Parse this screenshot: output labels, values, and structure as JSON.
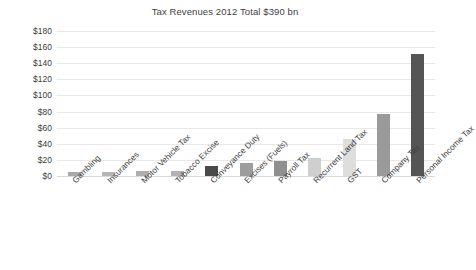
{
  "chart_data": {
    "type": "bar",
    "title": "Tax Revenues 2012 Total $390 bn",
    "xlabel": "",
    "ylabel": "",
    "ylim": [
      0,
      180
    ],
    "ytick_step": 20,
    "ytick_prefix": "$",
    "grid": true,
    "legend": false,
    "legend_position": "none",
    "x_label_rotation": -45,
    "categories": [
      "Gambling",
      "Insurances",
      "Motor Vehicle Tax",
      "Tobacco Excise",
      "Conveyance Duty",
      "Excises (Fuels)",
      "Payroll Tax",
      "Recurrent Land Tax",
      "GST",
      "Company Tax",
      "Personal Income Tax"
    ],
    "values": [
      5,
      5,
      6,
      6,
      12,
      16,
      19,
      22,
      46,
      77,
      152
    ],
    "bar_colors": [
      "#a8a8a8",
      "#b5b5b5",
      "#aeaeae",
      "#b2b2b2",
      "#4a4a4a",
      "#9d9d9d",
      "#8f8f8f",
      "#cfcfcf",
      "#dedede",
      "#9a9a9a",
      "#555555"
    ],
    "ytick_labels": [
      "$0",
      "$20",
      "$40",
      "$60",
      "$80",
      "$100",
      "$120",
      "$140",
      "$160",
      "$180"
    ],
    "ytick_values": [
      0,
      20,
      40,
      60,
      80,
      100,
      120,
      140,
      160,
      180
    ]
  },
  "style": {
    "background": "#ffffff",
    "grid_color": "#e8e8e8",
    "axis_color": "#d9d9d9",
    "text_color": "#3f3f3f"
  }
}
